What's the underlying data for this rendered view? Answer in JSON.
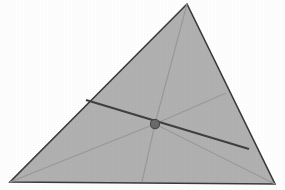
{
  "figure": {
    "type": "geometric-diagram",
    "canvas": {
      "width": 285,
      "height": 190
    },
    "background_color": "#ffffff"
  },
  "colors": {
    "triangle_fill": "#b1b1b1",
    "triangle_outline": "#3a3a3a",
    "cevian_strong": "#3f3f3f",
    "cevian_faint": "#9a9a9a",
    "center_point_fill": "#6a6a6a",
    "center_point_stroke": "#4a4a4a"
  },
  "triangle": {
    "name": "main-triangle",
    "fill": "#b1b1b1",
    "stroke": "#3a3a3a",
    "stroke_width": 1.6,
    "vertices": [
      {
        "label": "apex",
        "x": 187,
        "y": 4
      },
      {
        "label": "bottom-right",
        "x": 275,
        "y": 184
      },
      {
        "label": "bottom-left",
        "x": 10,
        "y": 182
      }
    ],
    "points_attr": "187,4 275,184 10,182"
  },
  "center_point": {
    "name": "interior-point",
    "x": 155,
    "y": 124,
    "radius": 4.6,
    "fill": "#6a6a6a",
    "stroke": "#4a4a4a",
    "stroke_width": 1.1
  },
  "lines": {
    "transversal": {
      "name": "dark-transversal",
      "description": "dark line crossing from left edge to right edge through the interior point",
      "x1": 86,
      "y1": 100,
      "x2": 249,
      "y2": 149,
      "stroke": "#3f3f3f",
      "stroke_width": 1.9
    },
    "cevians": [
      {
        "name": "cevian-to-apex",
        "description": "faint line from interior point up to the apex vertex",
        "x1": 155,
        "y1": 124,
        "x2": 187,
        "y2": 4,
        "stroke": "#9a9a9a",
        "stroke_width": 1.2
      },
      {
        "name": "cevian-to-bottom-left",
        "description": "faint line from interior point down-left to the bottom-left vertex",
        "x1": 155,
        "y1": 124,
        "x2": 10,
        "y2": 182,
        "stroke": "#9a9a9a",
        "stroke_width": 1.2
      },
      {
        "name": "cevian-to-bottom-right",
        "description": "faint line from interior point down-right to the bottom-right vertex",
        "x1": 155,
        "y1": 124,
        "x2": 275,
        "y2": 184,
        "stroke": "#9a9a9a",
        "stroke_width": 1.2
      },
      {
        "name": "cevian-to-base",
        "description": "faint near-vertical line from interior point down to the base edge",
        "x1": 155,
        "y1": 124,
        "x2": 142,
        "y2": 182,
        "stroke": "#9a9a9a",
        "stroke_width": 1.2
      },
      {
        "name": "cevian-to-right-edge",
        "description": "faint line from interior point up-right to the right edge",
        "x1": 155,
        "y1": 124,
        "x2": 226,
        "y2": 93,
        "stroke": "#9a9a9a",
        "stroke_width": 1.2
      }
    ]
  }
}
